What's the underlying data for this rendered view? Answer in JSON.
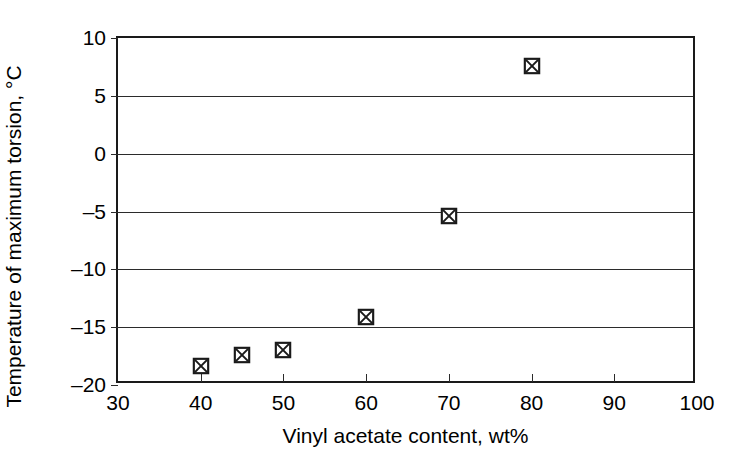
{
  "chart_data": {
    "type": "scatter",
    "title": "",
    "xlabel": "Vinyl acetate content, wt%",
    "ylabel": "Temperature of maximum torsion, °C",
    "xlim": [
      30,
      100
    ],
    "ylim": [
      -20,
      10
    ],
    "xticks": [
      30,
      40,
      50,
      60,
      70,
      80,
      90,
      100
    ],
    "xtick_labels": [
      "30",
      "40",
      "50",
      "60",
      "70",
      "80",
      "90",
      "100"
    ],
    "yticks": [
      10,
      5,
      0,
      -5,
      -10,
      -15,
      -20
    ],
    "ytick_labels": [
      "10",
      "5",
      "0",
      "–5",
      "–10",
      "–15",
      "–20"
    ],
    "grid": "horizontal",
    "legend": "none",
    "marker": "crossed-square",
    "marker_color": "#1a1a1a",
    "x": [
      40,
      45,
      50,
      60,
      70,
      80
    ],
    "values": [
      -18.4,
      -17.4,
      -17.0,
      -14.1,
      -5.4,
      7.6
    ],
    "points": [
      {
        "x": 40,
        "y": -18.4
      },
      {
        "x": 45,
        "y": -17.4
      },
      {
        "x": 50,
        "y": -17.0
      },
      {
        "x": 60,
        "y": -14.1
      },
      {
        "x": 70,
        "y": -5.4
      },
      {
        "x": 80,
        "y": 7.6
      }
    ]
  },
  "axes": {
    "frame_color": "#1a1a1a",
    "gridline_color": "#2b2b2b",
    "background": "#ffffff"
  }
}
